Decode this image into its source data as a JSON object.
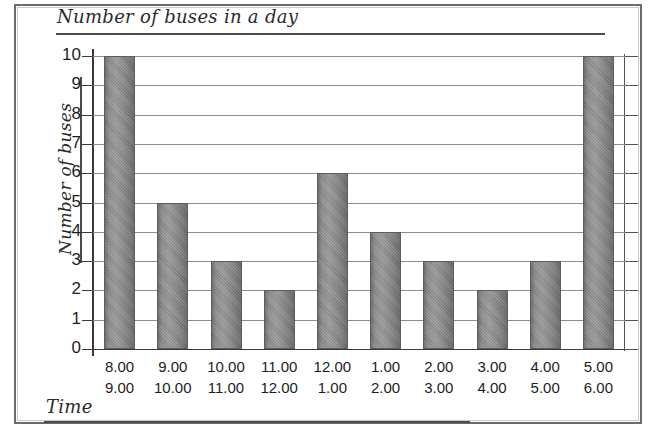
{
  "title": "Number of buses in a day",
  "axis_titles": {
    "y": "Number of buses",
    "x": "Time"
  },
  "chart_data": {
    "type": "bar",
    "title": "Number of buses in a day",
    "xlabel": "Time",
    "ylabel": "Number of buses",
    "ylim": [
      0,
      10
    ],
    "grid": true,
    "legend": "none",
    "yticks": [
      0,
      1,
      2,
      3,
      4,
      5,
      6,
      7,
      8,
      9,
      10
    ],
    "ytick_labels": [
      "0",
      "1",
      "2",
      "3",
      "4",
      "5",
      "6",
      "7",
      "8",
      "9",
      "10"
    ],
    "categories": [
      "8.00 9.00",
      "9.00 10.00",
      "10.00 11.00",
      "11.00 12.00",
      "12.00 1.00",
      "1.00 2.00",
      "2.00 3.00",
      "3.00 4.00",
      "4.00 5.00",
      "5.00 6.00"
    ],
    "category_starts": [
      "8.00",
      "9.00",
      "10.00",
      "11.00",
      "12.00",
      "1.00",
      "2.00",
      "3.00",
      "4.00",
      "5.00"
    ],
    "category_ends": [
      "9.00",
      "10.00",
      "11.00",
      "12.00",
      "1.00",
      "2.00",
      "3.00",
      "4.00",
      "5.00",
      "6.00"
    ],
    "values": [
      10,
      5,
      3,
      2,
      6,
      4,
      3,
      2,
      3,
      10
    ],
    "bar_color": "#8c8c8c",
    "bar_edge_color": "#5d5d5d"
  },
  "colors": {
    "ink": "#2a2a2a",
    "axis": "#3a3a3a",
    "gridline": "#8d8d8d",
    "frame": "#6b6b6b",
    "page_background": "#ffffff"
  }
}
